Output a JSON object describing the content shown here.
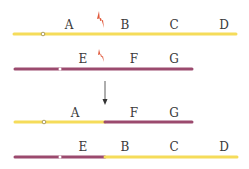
{
  "colors": {
    "yellow": "#f5dc5a",
    "purple": "#9b4a6e",
    "bolt": "#e0583a",
    "arrow": "#333333",
    "text": "#3a3a3a"
  },
  "before": {
    "chromosome_1": {
      "color": "yellow",
      "labels": [
        "A",
        "B",
        "C",
        "D"
      ],
      "break_between": [
        "A",
        "B"
      ]
    },
    "chromosome_2": {
      "color": "purple",
      "labels": [
        "E",
        "F",
        "G"
      ],
      "break_between": [
        "E",
        "F"
      ]
    }
  },
  "after": {
    "chromosome_1": {
      "segments": [
        "yellow",
        "purple"
      ],
      "labels": [
        "A",
        "F",
        "G"
      ]
    },
    "chromosome_2": {
      "segments": [
        "purple",
        "yellow"
      ],
      "labels": [
        "E",
        "B",
        "C",
        "D"
      ]
    }
  },
  "labels": {
    "r1": [
      "A",
      "B",
      "C",
      "D"
    ],
    "r2": [
      "E",
      "F",
      "G"
    ],
    "r3": [
      "A",
      "F",
      "G"
    ],
    "r4": [
      "E",
      "B",
      "C",
      "D"
    ]
  }
}
